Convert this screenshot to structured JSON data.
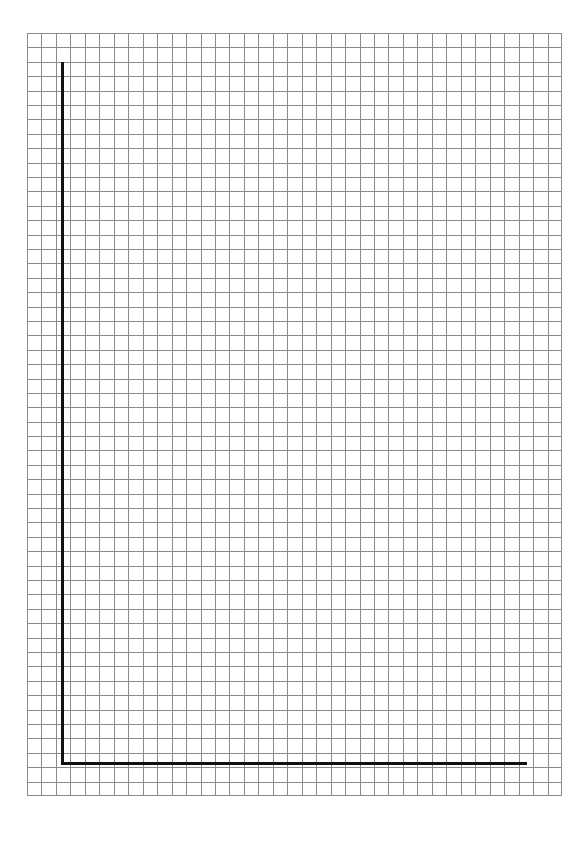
{
  "page": {
    "width": 588,
    "height": 845,
    "background_color": "#ffffff",
    "kind": "graph-paper-worksheet"
  },
  "header": {
    "text": "",
    "note": "clipped / illegible faint text fragments along the very top edge"
  },
  "grid": {
    "label": "graph-paper-grid",
    "line_color": "#8a8a8e",
    "line_width_px": 1,
    "cell_size_px": 14.45,
    "columns": 37,
    "rows": 53,
    "left_px": 27,
    "top_px": 33,
    "width_px": 535,
    "height_px": 763,
    "emphasis_lines": "none"
  },
  "axes": {
    "color": "#111111",
    "stroke_width_px": 3,
    "y_axis": {
      "label": "vertical-axis",
      "x_px": 62,
      "top_px": 62,
      "bottom_px": 765,
      "length_px": 703
    },
    "x_axis": {
      "label": "horizontal-axis",
      "y_px": 763,
      "left_px": 62,
      "right_px": 528,
      "length_px": 466
    },
    "origin": {
      "x_px": 62,
      "y_px": 763
    }
  },
  "chart_data": {
    "type": "line",
    "title": "",
    "subtitle": "",
    "xlabel": "",
    "ylabel": "",
    "grid": true,
    "legend": "none",
    "annotations": [],
    "categories": [],
    "x": [],
    "values": [],
    "series": [],
    "xlim": [
      0,
      32
    ],
    "ylim": [
      0,
      49
    ],
    "xticks": [],
    "yticks": []
  }
}
